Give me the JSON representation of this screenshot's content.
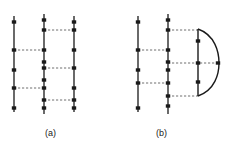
{
  "figure": {
    "title": "",
    "background_color": "#ffffff",
    "stroke_color": "#1a1a1a",
    "dash_color": "#6e6e6e",
    "node_color": "#1a1a1a",
    "panels": [
      {
        "id": "a",
        "caption": "(a)",
        "description": "three parallel vertical world-lines connected by horizontal dashed interaction lines",
        "vertical_lines": [
          {
            "name": "line-1",
            "x": 14,
            "y_top": 16,
            "y_bottom": 112
          },
          {
            "name": "line-2",
            "x": 44,
            "y_top": 14,
            "y_bottom": 114
          },
          {
            "name": "line-3",
            "x": 74,
            "y_top": 16,
            "y_bottom": 112
          }
        ],
        "nodes": [
          {
            "x": 14,
            "y": 22
          },
          {
            "x": 14,
            "y": 50
          },
          {
            "x": 14,
            "y": 70
          },
          {
            "x": 14,
            "y": 88
          },
          {
            "x": 14,
            "y": 108
          },
          {
            "x": 44,
            "y": 20
          },
          {
            "x": 44,
            "y": 30
          },
          {
            "x": 44,
            "y": 50
          },
          {
            "x": 44,
            "y": 62
          },
          {
            "x": 44,
            "y": 68
          },
          {
            "x": 44,
            "y": 80
          },
          {
            "x": 44,
            "y": 88
          },
          {
            "x": 44,
            "y": 100
          },
          {
            "x": 44,
            "y": 108
          },
          {
            "x": 74,
            "y": 22
          },
          {
            "x": 74,
            "y": 30
          },
          {
            "x": 74,
            "y": 50
          },
          {
            "x": 74,
            "y": 68
          },
          {
            "x": 74,
            "y": 88
          },
          {
            "x": 74,
            "y": 100
          },
          {
            "x": 74,
            "y": 108
          }
        ],
        "dashed_links": [
          {
            "x1": 44,
            "x2": 74,
            "y": 30
          },
          {
            "x1": 14,
            "x2": 44,
            "y": 50
          },
          {
            "x1": 44,
            "x2": 74,
            "y": 68
          },
          {
            "x1": 14,
            "x2": 44,
            "y": 88
          },
          {
            "x1": 44,
            "x2": 74,
            "y": 100
          }
        ]
      },
      {
        "id": "b",
        "caption": "(b)",
        "description": "two parallel vertical world-lines plus a closed self-energy loop on the right",
        "vertical_lines": [
          {
            "name": "line-1",
            "x": 138,
            "y_top": 16,
            "y_bottom": 112
          },
          {
            "name": "line-2",
            "x": 168,
            "y_top": 14,
            "y_bottom": 114
          }
        ],
        "loop": {
          "name": "self-energy-loop",
          "straight_x": 198,
          "y_top": 29,
          "y_bottom": 96,
          "arc_apex_x": 218,
          "arc_apex_y": 63
        },
        "nodes": [
          {
            "x": 138,
            "y": 22
          },
          {
            "x": 138,
            "y": 50
          },
          {
            "x": 138,
            "y": 70
          },
          {
            "x": 138,
            "y": 83
          },
          {
            "x": 138,
            "y": 108
          },
          {
            "x": 168,
            "y": 20
          },
          {
            "x": 168,
            "y": 30
          },
          {
            "x": 168,
            "y": 50
          },
          {
            "x": 168,
            "y": 62
          },
          {
            "x": 168,
            "y": 70
          },
          {
            "x": 168,
            "y": 83
          },
          {
            "x": 168,
            "y": 96
          },
          {
            "x": 168,
            "y": 106
          },
          {
            "x": 198,
            "y": 41
          },
          {
            "x": 198,
            "y": 63
          },
          {
            "x": 198,
            "y": 82
          },
          {
            "x": 218,
            "y": 63
          }
        ],
        "dashed_links": [
          {
            "x1": 168,
            "x2": 198,
            "y": 30
          },
          {
            "x1": 138,
            "x2": 168,
            "y": 50
          },
          {
            "x1": 168,
            "x2": 218,
            "y": 63
          },
          {
            "x1": 138,
            "x2": 168,
            "y": 83
          },
          {
            "x1": 168,
            "x2": 198,
            "y": 96
          }
        ]
      }
    ]
  }
}
